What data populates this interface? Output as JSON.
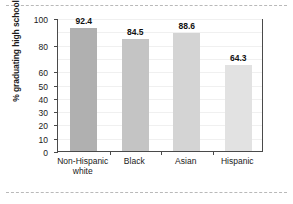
{
  "chart_data": {
    "type": "bar",
    "title": "",
    "xlabel": "",
    "ylabel": "% graduating high school",
    "categories": [
      "Non-Hispanic\nwhite",
      "Black",
      "Asian",
      "Hispanic"
    ],
    "values": [
      92.4,
      84.5,
      88.6,
      64.3
    ],
    "value_labels": [
      "92.4",
      "84.5",
      "88.6",
      "64.3"
    ],
    "ylim": [
      0,
      100
    ],
    "ytick_values": [
      0,
      10,
      20,
      30,
      40,
      50,
      60,
      80,
      100
    ],
    "ytick_labels": [
      "0",
      "10",
      "20",
      "30",
      "40",
      "50",
      "60",
      "80",
      "100"
    ],
    "grid": true,
    "legend": null,
    "bar_colors": [
      "#b0b0b0",
      "#c4c4c4",
      "#d4d4d4",
      "#e2e2e2"
    ],
    "axis_color": "#4a4a4a",
    "gridline_color": "#f0f0f0",
    "text_color": "#1a1a1a"
  }
}
